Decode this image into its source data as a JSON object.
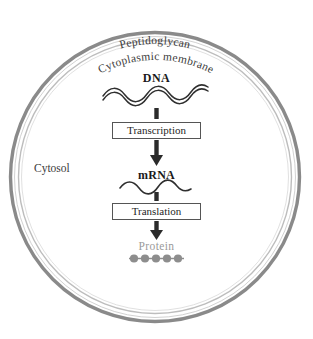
{
  "diagram": {
    "cell": {
      "outer_layer_label": "Peptidoglycan",
      "inner_layer_label": "Cytoplasmic membrane",
      "interior_label": "Cytosol"
    },
    "flow": {
      "dna_label": "DNA",
      "transcription_label": "Transcription",
      "mrna_label": "mRNA",
      "translation_label": "Translation",
      "protein_label": "Protein"
    },
    "colors": {
      "peptidoglycan_ring": "#8a8a8a",
      "membrane_ring": "#c6c6c6",
      "arrow": "#2b2b2b",
      "box_border": "#555555",
      "protein_text": "#9a9a9a",
      "protein_bead": "#8d8d8d",
      "label_text": "#3a3a3a",
      "background": "#ffffff"
    },
    "protein_beads": 5
  }
}
